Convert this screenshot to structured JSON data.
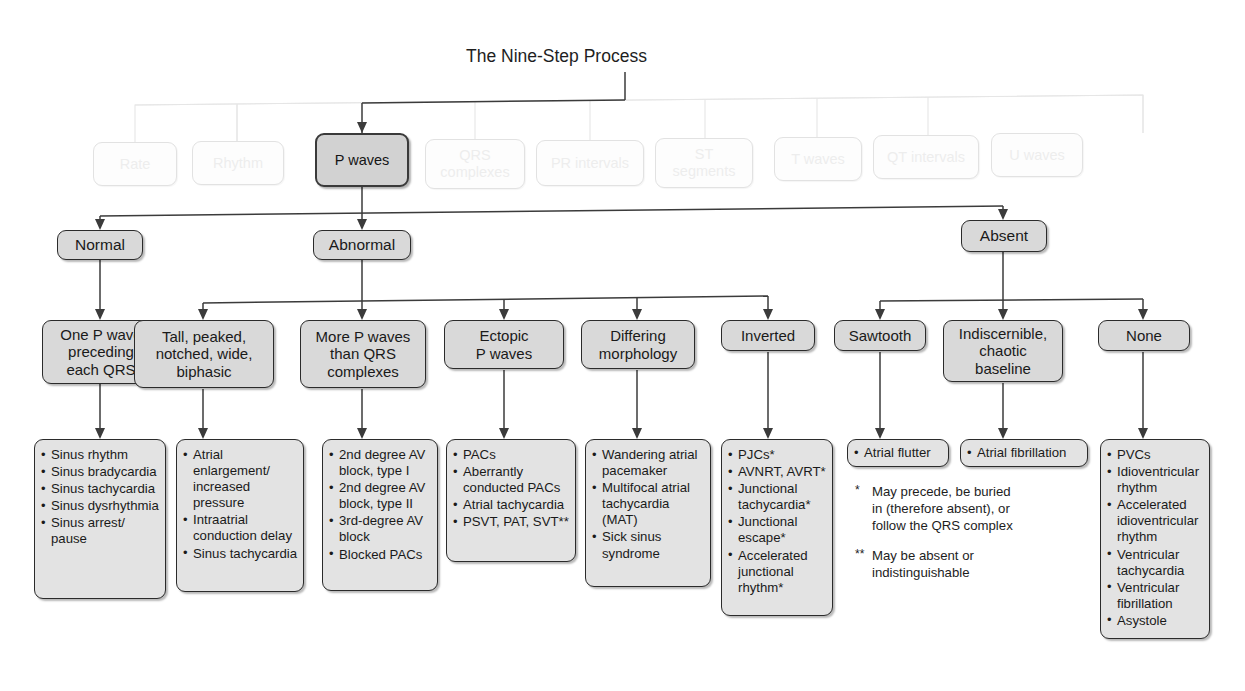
{
  "title": "The Nine-Step Process",
  "nine_steps": [
    {
      "label": "Rate",
      "active": false
    },
    {
      "label": "Rhythm",
      "active": false
    },
    {
      "label": "P waves",
      "active": true
    },
    {
      "label": "QRS\ncomplexes",
      "active": false
    },
    {
      "label": "PR intervals",
      "active": false
    },
    {
      "label": "ST\nsegments",
      "active": false
    },
    {
      "label": "T waves",
      "active": false
    },
    {
      "label": "QT intervals",
      "active": false
    },
    {
      "label": "U waves",
      "active": false
    }
  ],
  "level2": [
    {
      "label": "Normal"
    },
    {
      "label": "Abnormal"
    },
    {
      "label": "Absent"
    }
  ],
  "level3": [
    {
      "label": "One P wave\npreceding\neach QRS"
    },
    {
      "label": "Tall, peaked,\nnotched, wide,\nbiphasic"
    },
    {
      "label": "More P waves\nthan QRS\ncomplexes"
    },
    {
      "label": "Ectopic\nP waves"
    },
    {
      "label": "Differing\nmorphology"
    },
    {
      "label": "Inverted"
    },
    {
      "label": "Sawtooth"
    },
    {
      "label": "Indiscernible,\nchaotic\nbaseline"
    },
    {
      "label": "None"
    }
  ],
  "lists": [
    {
      "name": "normal-one-p-wave-list",
      "items": [
        "Sinus rhythm",
        "Sinus bradycardia",
        "Sinus tachycardia",
        "Sinus dysrhythmia",
        "Sinus arrest/ pause"
      ]
    },
    {
      "name": "tall-peaked-list",
      "items": [
        "Atrial enlargement/ increased pressure",
        "Intraatrial conduction delay",
        "Sinus tachycardia"
      ]
    },
    {
      "name": "more-p-waves-list",
      "items": [
        "2nd degree AV block, type I",
        "2nd degree AV block, type II",
        "3rd-degree AV block",
        "Blocked PACs"
      ]
    },
    {
      "name": "ectopic-p-waves-list",
      "items": [
        "PACs",
        "Aberrantly conducted PACs",
        "Atrial tachycardia",
        "PSVT, PAT, SVT**"
      ]
    },
    {
      "name": "differing-morphology-list",
      "items": [
        "Wandering atrial pacemaker",
        "Multifocal atrial tachycardia (MAT)",
        "Sick sinus syndrome"
      ]
    },
    {
      "name": "inverted-list",
      "items": [
        "PJCs*",
        "AVNRT, AVRT*",
        "Junctional tachycardia*",
        "Junctional escape*",
        "Accelerated junctional rhythm*"
      ]
    },
    {
      "name": "sawtooth-list",
      "items": [
        "Atrial flutter"
      ]
    },
    {
      "name": "indiscernible-list",
      "items": [
        "Atrial fibrillation"
      ]
    },
    {
      "name": "none-list",
      "items": [
        "PVCs",
        "Idioventricular rhythm",
        "Accelerated idioventricular rhythm",
        "Ventricular tachycardia",
        "Ventricular fibrillation",
        "Asystole"
      ]
    }
  ],
  "footnotes": [
    {
      "marker": "*",
      "text": "May precede, be buried in (therefore absent), or follow the QRS complex"
    },
    {
      "marker": "**",
      "text": "May be absent or indistinguishable"
    }
  ],
  "colors": {
    "node_fill": "#d9d9d9",
    "list_fill": "#e3e3e3",
    "border": "#2b2b2b",
    "faded_border": "#e2e2e2",
    "faded_text": "#ededed",
    "wire": "#3b3b3b",
    "faded_wire": "#e6e6e6"
  }
}
